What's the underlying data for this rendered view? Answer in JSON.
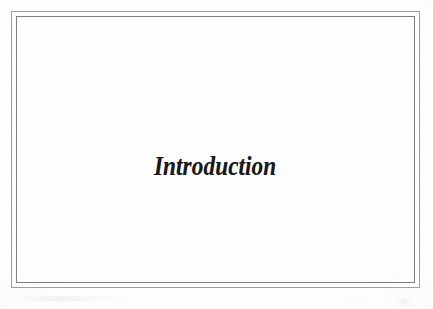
{
  "document": {
    "page_type": "chapter-divider",
    "background_color": "#fefefe",
    "frame": {
      "style": "double-rule-border",
      "outer_line_color": "#9d9d9d",
      "inner_line_color": "#7f7f7f"
    }
  },
  "content": {
    "chapter_title": "Introduction",
    "title_color": "#191919",
    "title_alignment": "center"
  }
}
